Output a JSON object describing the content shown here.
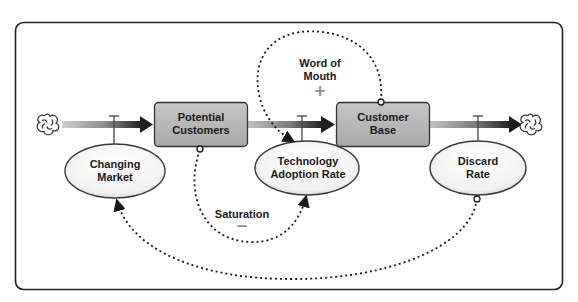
{
  "diagram": {
    "type": "stock-and-flow",
    "stocks": [
      {
        "id": "potential_customers",
        "label_line1": "Potential",
        "label_line2": "Customers"
      },
      {
        "id": "customer_base",
        "label_line1": "Customer",
        "label_line2": "Base"
      }
    ],
    "auxiliaries": [
      {
        "id": "changing_market",
        "label_line1": "Changing",
        "label_line2": "Market"
      },
      {
        "id": "technology_adoption_rate",
        "label_line1": "Technology",
        "label_line2": "Adoption Rate"
      },
      {
        "id": "discard_rate",
        "label_line1": "Discard",
        "label_line2": "Rate"
      }
    ],
    "loops": [
      {
        "id": "word_of_mouth",
        "label_line1": "Word of",
        "label_line2": "Mouth",
        "polarity": "+"
      },
      {
        "id": "saturation",
        "label": "Saturation",
        "polarity": "−"
      }
    ],
    "sources_sinks": [
      {
        "id": "source",
        "icon": "cloud-icon"
      },
      {
        "id": "sink",
        "icon": "cloud-icon"
      }
    ],
    "colors": {
      "stock_fill": "#b9b9b9",
      "stock_border": "#3a3a3a",
      "pipe_dark": "#2a2a2a",
      "pipe_light": "#c8c8c8",
      "ellipse_fill": "#f4f4f4",
      "frame": "#222222",
      "sign": "#8c8c8c"
    }
  }
}
